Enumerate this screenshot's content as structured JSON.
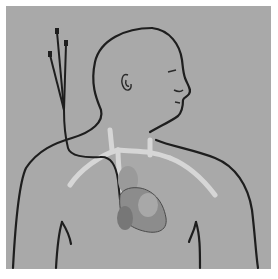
{
  "figure": {
    "colors": {
      "background": "#ffffff",
      "panel": "#a9a9a9",
      "outline": "#1e1e1e",
      "vessel": "#d4d4d4",
      "heart": "#8a8a8a"
    },
    "elements": [
      "human-silhouette",
      "catheter-lumens",
      "heart",
      "great-vessels"
    ]
  }
}
